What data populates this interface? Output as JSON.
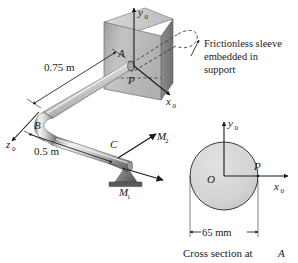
{
  "figure": {
    "background_color": "#ffffff",
    "line_color": "#1a1a1a",
    "pipe_color_light": "#efefef",
    "pipe_color_mid": "#b9b9b9",
    "pipe_color_dark": "#6f6f6f",
    "plate_color_light": "#cfcfcf",
    "plate_color_mid": "#a8a8a8",
    "plate_color_dark": "#7e7e7e",
    "section_fill": "#d5d5d5"
  },
  "main_view": {
    "axes": {
      "y_axis_label": "y",
      "y_axis_sub": "0",
      "x_axis_label": "x",
      "x_axis_sub": "0",
      "z_axis_label": "z",
      "z_axis_sub": "0"
    },
    "points": {
      "a_label": "A",
      "b_label": "B",
      "c_label": "C",
      "p_label": "P"
    },
    "dimensions": [
      {
        "id": "dim-ab",
        "text": "0.75 m"
      },
      {
        "id": "dim-bc",
        "text": "0.5 m"
      }
    ],
    "moments": [
      {
        "id": "moment-2",
        "label": "M",
        "sub": "2"
      },
      {
        "id": "moment-1",
        "label": "M",
        "sub": "1"
      }
    ],
    "callout": {
      "line1": "Frictionless sleeve",
      "line2": "embedded in",
      "line3": "support"
    }
  },
  "cross_section": {
    "axes": {
      "y_axis_label": "y",
      "y_axis_sub": "0",
      "x_axis_label": "x",
      "x_axis_sub": "0"
    },
    "center_label": "O",
    "edge_point_label": "P",
    "diameter_label": "65 mm",
    "caption_prefix": "Cross section at ",
    "caption_point": "A"
  }
}
